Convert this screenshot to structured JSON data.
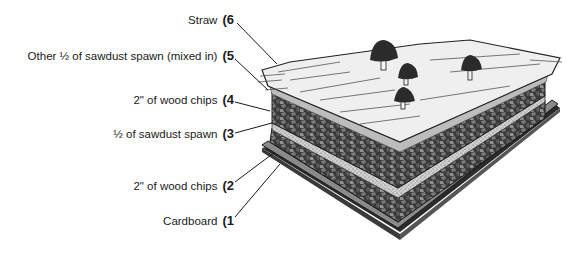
{
  "diagram": {
    "type": "layered-cross-section",
    "layers": [
      {
        "num": "(1",
        "label": "Cardboard"
      },
      {
        "num": "(2",
        "label": "2\" of wood chips"
      },
      {
        "num": "(3",
        "label": "½ of sawdust spawn"
      },
      {
        "num": "(4",
        "label": "2\" of wood chips"
      },
      {
        "num": "(5",
        "label": "Other ½ of sawdust spawn (mixed in)"
      },
      {
        "num": "(6",
        "label": "Straw"
      }
    ],
    "colors": {
      "text": "#1a1a1a",
      "straw": "#ececec",
      "chips_dark": "#3a3a3a",
      "chips_mid": "#6e6e6e",
      "sawdust": "#c8c8c8",
      "cardboard": "#8a8a8a",
      "mushroom_cap": "#2b2b2b"
    }
  }
}
